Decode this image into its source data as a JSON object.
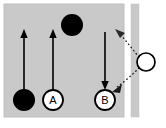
{
  "figure": {
    "name": "projectile-collision-diagram",
    "colors": {
      "background": "#ffffff",
      "panel": "#c9c9c9",
      "panel_edge": "#bdbdbd",
      "wall_band": "#c9c9c9",
      "stroke": "#000000",
      "ball_fill": "#000000",
      "open_ball_fill": "#ffffff"
    },
    "panel": {
      "x": 4,
      "y": 4,
      "width": 120,
      "height": 113
    },
    "wall": {
      "x": 131,
      "y": 4,
      "width": 8,
      "height": 113
    },
    "labels": {
      "ball_a": "A",
      "ball_b": "B"
    },
    "balls": [
      {
        "name": "black-ball-bottom-left",
        "cx": 24,
        "cy": 100,
        "r": 11,
        "style": "filled",
        "label": ""
      },
      {
        "name": "ball-a",
        "cx": 53,
        "cy": 100,
        "r": 10,
        "style": "open",
        "label": "A"
      },
      {
        "name": "black-ball-top",
        "cx": 72,
        "cy": 25,
        "r": 11,
        "style": "filled",
        "label": ""
      },
      {
        "name": "ball-b",
        "cx": 105,
        "cy": 100,
        "r": 10,
        "style": "open",
        "label": "B"
      },
      {
        "name": "open-ball-right",
        "cx": 146,
        "cy": 62,
        "r": 9,
        "style": "open-thin",
        "label": ""
      }
    ],
    "arrows": [
      {
        "name": "velocity-arrow-left-up",
        "x1": 24,
        "y1": 90,
        "x2": 24,
        "y2": 31,
        "direction": "up"
      },
      {
        "name": "velocity-arrow-a-up",
        "x1": 53,
        "y1": 90,
        "x2": 53,
        "y2": 31,
        "direction": "up"
      },
      {
        "name": "velocity-arrow-b-down",
        "x1": 105,
        "y1": 32,
        "x2": 105,
        "y2": 89,
        "direction": "down"
      }
    ],
    "dotted_paths": [
      {
        "name": "dotted-path-upper",
        "d": "M 139 57 C 133 50 127 42 120 35",
        "arrowhead": {
          "x": 118,
          "y": 33,
          "angle": -135
        }
      },
      {
        "name": "dotted-path-lower",
        "d": "M 139 68 C 132 75 124 82 116 88",
        "arrowhead": {
          "x": 114,
          "y": 90,
          "angle": 135
        }
      }
    ]
  }
}
